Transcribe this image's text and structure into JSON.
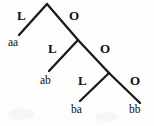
{
  "figure": {
    "type": "binary-tree-diagram",
    "width": 154,
    "height": 126,
    "background_color": "#fdfdfc",
    "stroke_color": "#1a1a1a",
    "text_color": "#101010"
  },
  "branch_labels": [
    {
      "id": "l1",
      "text": "L",
      "x": 17,
      "y": 9
    },
    {
      "id": "o1",
      "text": "O",
      "x": 69,
      "y": 9
    },
    {
      "id": "l2",
      "text": "L",
      "x": 48,
      "y": 42
    },
    {
      "id": "o2",
      "text": "O",
      "x": 100,
      "y": 42
    },
    {
      "id": "l3",
      "text": "L",
      "x": 78,
      "y": 74
    },
    {
      "id": "o3",
      "text": "O",
      "x": 130,
      "y": 74
    }
  ],
  "leaf_labels": [
    {
      "id": "leaf-aa",
      "text": "aa",
      "x": 8,
      "y": 37
    },
    {
      "id": "leaf-ab",
      "text": "ab",
      "x": 40,
      "y": 75
    },
    {
      "id": "leaf-ba",
      "text": "ba",
      "x": 71,
      "y": 104
    },
    {
      "id": "leaf-bb",
      "text": "bb",
      "x": 129,
      "y": 104
    }
  ],
  "edges": [
    {
      "id": "edge-root-aa",
      "label": "L",
      "x1": 47,
      "y1": 4,
      "x2": 19,
      "y2": 35
    },
    {
      "id": "edge-root-n2",
      "label": "O",
      "x1": 47,
      "y1": 4,
      "x2": 78,
      "y2": 40
    },
    {
      "id": "edge-n2-ab",
      "label": "L",
      "x1": 78,
      "y1": 40,
      "x2": 49,
      "y2": 71
    },
    {
      "id": "edge-n2-n3",
      "label": "O",
      "x1": 78,
      "y1": 40,
      "x2": 109,
      "y2": 73
    },
    {
      "id": "edge-n3-ba",
      "label": "L",
      "x1": 109,
      "y1": 73,
      "x2": 80,
      "y2": 101
    },
    {
      "id": "edge-n3-bb",
      "label": "O",
      "x1": 109,
      "y1": 73,
      "x2": 140,
      "y2": 103
    }
  ]
}
